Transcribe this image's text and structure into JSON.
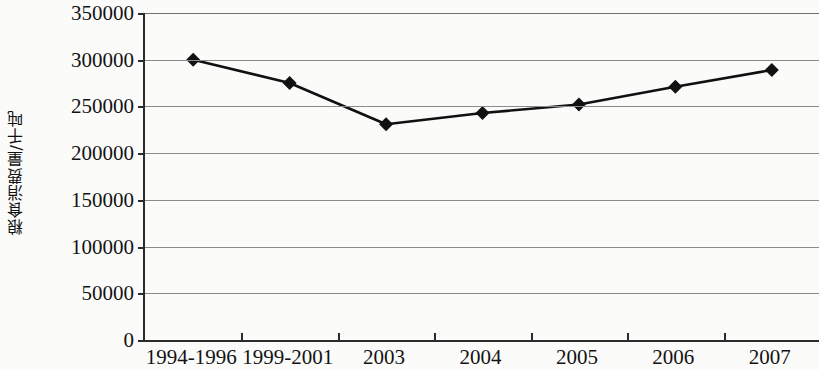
{
  "chart_data": {
    "type": "line",
    "title": "",
    "subtitle": "",
    "xlabel": "",
    "ylabel": "粮食消费量/千吨",
    "categories": [
      "1994-1996",
      "1999-2001",
      "2003",
      "2004",
      "2005",
      "2006",
      "2007"
    ],
    "series": [
      {
        "name": "粮食消费量",
        "values": [
          300000,
          275000,
          231000,
          243000,
          252000,
          271000,
          289000
        ]
      }
    ],
    "ylim": [
      0,
      350000
    ],
    "y_ticks": [
      0,
      50000,
      100000,
      150000,
      200000,
      250000,
      300000,
      350000
    ],
    "y_tick_labels": [
      "0",
      "50000",
      "100000",
      "150000",
      "200000",
      "250000",
      "300000",
      "350000"
    ],
    "grid": true,
    "legend": "none",
    "marker": "diamond",
    "line_color": "#111111",
    "marker_color": "#111111",
    "grid_color": "#8b8b8b",
    "axis_color": "#2b2b2b"
  }
}
